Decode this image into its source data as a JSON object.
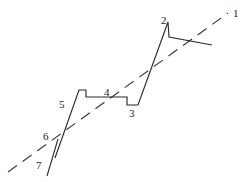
{
  "figure": {
    "type": "line-diagram",
    "width": 246,
    "height": 182,
    "background_color": "#ffffff",
    "stroke_color": "#2b2b2b",
    "labels": [
      {
        "id": "1",
        "text": "1",
        "x": 233,
        "y": 8
      },
      {
        "id": "2",
        "text": "2",
        "x": 161,
        "y": 15
      },
      {
        "id": "3",
        "text": "3",
        "x": 129,
        "y": 108
      },
      {
        "id": "4",
        "text": "4",
        "x": 104,
        "y": 87
      },
      {
        "id": "5",
        "text": "5",
        "x": 59,
        "y": 99
      },
      {
        "id": "6",
        "text": "6",
        "x": 43,
        "y": 131
      },
      {
        "id": "7",
        "text": "7",
        "x": 36,
        "y": 160
      }
    ],
    "paths": {
      "stair": "M 55,158 L 79,90 L 86,90 L 86,97 L 127,97 L 127,105 L 138,105 L 138,104 L 155,58 L 168,22 L 169,22 L 169,37 L 212,37 L 212,45 L 212,45",
      "stair_simplified": "M 55,158 L 79,90 L 86,90 L 86,97 L 127,97 L 127,105 L 138,105 L 155,58 L 168,22 L 169,37 L 212,45",
      "tick": "M 47,176 L 58,139",
      "trend": "M 8,172 L 228,13"
    },
    "trend_style": {
      "dash_pattern": "11 7",
      "stroke_width": 1.15
    }
  }
}
